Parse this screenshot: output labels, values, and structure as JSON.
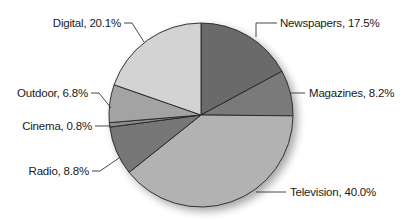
{
  "chart_data": {
    "type": "pie",
    "title": "",
    "start_angle_deg": 0,
    "direction": "clockwise",
    "slices": [
      {
        "label": "Newspapers",
        "value": 17.5,
        "display": "Newspapers, 17.5%",
        "color": "#6b6b6b"
      },
      {
        "label": "Magazines",
        "value": 8.2,
        "display": "Magazines, 8.2%",
        "color": "#7a7a7a"
      },
      {
        "label": "Television",
        "value": 40.0,
        "display": "Television, 40.0%",
        "color": "#b2b2b2"
      },
      {
        "label": "Radio",
        "value": 8.8,
        "display": "Radio, 8.8%",
        "color": "#777777"
      },
      {
        "label": "Cinema",
        "value": 0.8,
        "display": "Cinema, 0.8%",
        "color": "#8c8c8c"
      },
      {
        "label": "Outdoor",
        "value": 6.8,
        "display": "Outdoor, 6.8%",
        "color": "#a3a3a3"
      },
      {
        "label": "Digital",
        "value": 20.1,
        "display": "Digital, 20.1%",
        "color": "#d3d3d3"
      }
    ],
    "legend": "none",
    "labels": "outside with leader lines"
  },
  "labels": {
    "newspapers": "Newspapers, 17.5%",
    "magazines": "Magazines, 8.2%",
    "television": "Television, 40.0%",
    "radio": "Radio, 8.8%",
    "cinema": "Cinema, 0.8%",
    "outdoor": "Outdoor, 6.8%",
    "digital": "Digital, 20.1%"
  }
}
